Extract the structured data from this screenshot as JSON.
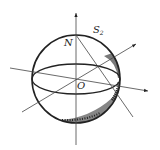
{
  "diagram": {
    "type": "sphere-geometry",
    "labels": {
      "north_pole": "N",
      "center": "O",
      "surface": "S",
      "surface_subscript": "2"
    },
    "colors": {
      "stroke": "#222222",
      "background": "#ffffff"
    }
  }
}
